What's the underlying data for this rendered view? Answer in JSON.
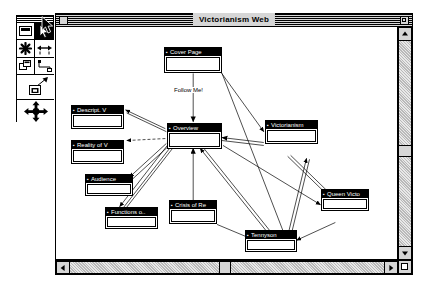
{
  "window": {
    "title": "Victorianism Web",
    "close_label": "",
    "zoom_label": ""
  },
  "palette": {
    "name": "tool-palette",
    "tools": [
      {
        "id": "text-tool",
        "label": "",
        "selected": false
      },
      {
        "id": "pointer-tool",
        "label": "",
        "selected": true
      },
      {
        "id": "note-tool",
        "label": "",
        "selected": false
      },
      {
        "id": "link-tool",
        "label": "",
        "selected": false
      },
      {
        "id": "stack-tool",
        "label": "",
        "selected": false
      },
      {
        "id": "path-tool",
        "label": "",
        "selected": false
      },
      {
        "id": "create-tool",
        "label": "",
        "selected": false
      },
      {
        "id": "hand-tool",
        "label": "",
        "selected": false
      }
    ]
  },
  "map": {
    "link_label": "Follow Me!",
    "nodes": [
      {
        "id": "cover-page",
        "title": "Cover Page",
        "x": 163,
        "y": 33,
        "w": 58,
        "h": 26
      },
      {
        "id": "descript-v",
        "title": "Descript. V",
        "x": 70,
        "y": 91,
        "w": 53,
        "h": 24
      },
      {
        "id": "reality-of-v",
        "title": "Reality of V",
        "x": 70,
        "y": 126,
        "w": 53,
        "h": 24
      },
      {
        "id": "overview",
        "title": "Overview",
        "x": 166,
        "y": 122,
        "w": 55,
        "h": 26
      },
      {
        "id": "victorianism",
        "title": "Victorianism",
        "x": 264,
        "y": 119,
        "w": 53,
        "h": 24
      },
      {
        "id": "audience",
        "title": "Audience",
        "x": 84,
        "y": 173,
        "w": 48,
        "h": 22
      },
      {
        "id": "functions-o",
        "title": "Functions o..",
        "x": 104,
        "y": 206,
        "w": 53,
        "h": 22
      },
      {
        "id": "crisis-of-re",
        "title": "Crisis of Re",
        "x": 168,
        "y": 199,
        "w": 48,
        "h": 24
      },
      {
        "id": "queen-victo",
        "title": "Queen Victo",
        "x": 320,
        "y": 188,
        "w": 48,
        "h": 22
      },
      {
        "id": "tennyson",
        "title": "Tennyson",
        "x": 244,
        "y": 229,
        "w": 52,
        "h": 22
      }
    ]
  },
  "scrollbars": {
    "vertical": {
      "up": "",
      "down": "",
      "thumb_position": "118"
    },
    "horizontal": {
      "left": "",
      "right": "",
      "thumb_position": "163"
    }
  },
  "colors": {
    "desktop": "#ffffff",
    "chrome": "#d6d6d6",
    "ink": "#000000",
    "paper": "#ffffff"
  }
}
